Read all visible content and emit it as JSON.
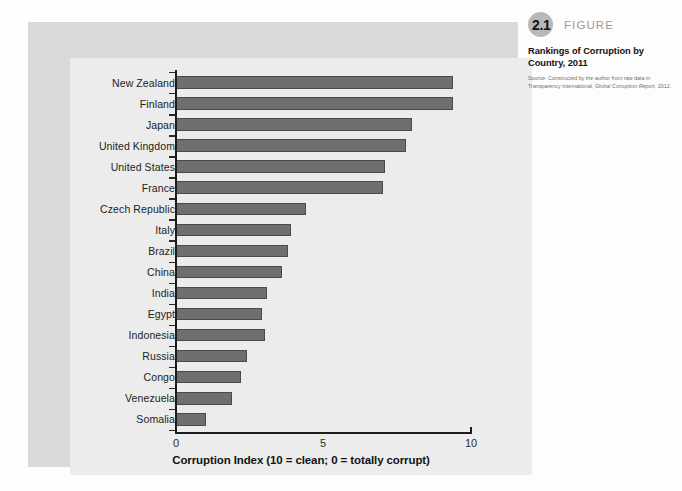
{
  "figure": {
    "number": "2.1",
    "word": "FIGURE",
    "title": "Rankings of Corruption by Country, 2011",
    "source_prefix": "Source: Constructed by the author from raw data in Transparency International, ",
    "source_italic": "Global Corruption Report",
    "source_suffix": ", 2012."
  },
  "chart_data": {
    "type": "bar",
    "orientation": "horizontal",
    "title": "Rankings of Corruption by Country, 2011",
    "xlabel": "Corruption Index (10 = clean; 0 = totally corrupt)",
    "ylabel": "",
    "xlim": [
      0,
      10
    ],
    "xticks": [
      0,
      5,
      10
    ],
    "xtick_labels": [
      "0",
      "5",
      "10"
    ],
    "grid": false,
    "legend": false,
    "bar_color": "#6f6f6f",
    "categories": [
      "New Zealand",
      "Finland",
      "Japan",
      "United Kingdom",
      "United States",
      "France",
      "Czech Republic",
      "Italy",
      "Brazil",
      "China",
      "India",
      "Egypt",
      "Indonesia",
      "Russia",
      "Congo",
      "Venezuela",
      "Somalia"
    ],
    "values": [
      9.4,
      9.4,
      8.0,
      7.8,
      7.1,
      7.0,
      4.4,
      3.9,
      3.8,
      3.6,
      3.1,
      2.9,
      3.0,
      2.4,
      2.2,
      1.9,
      1.0
    ]
  },
  "axis": {
    "tick_0": "0",
    "tick_5": "5",
    "tick_10": "10",
    "title": "Corruption Index (10 = clean; 0 = totally corrupt)"
  }
}
